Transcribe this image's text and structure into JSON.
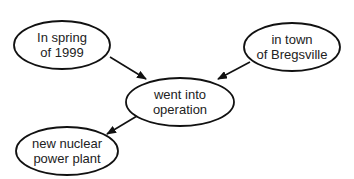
{
  "diagram": {
    "type": "concept-map",
    "colors": {
      "stroke": "#111111",
      "text": "#222222",
      "background": "#ffffff"
    },
    "nodes": [
      {
        "id": "time",
        "line1": "In spring",
        "line2": "of 1999",
        "cx": 62,
        "cy": 45,
        "rx": 48,
        "ry": 24
      },
      {
        "id": "place",
        "line1": "in town",
        "line2": "of Bregsville",
        "cx": 292,
        "cy": 47,
        "rx": 48,
        "ry": 24
      },
      {
        "id": "event",
        "line1": "went into",
        "line2": "operation",
        "cx": 180,
        "cy": 102,
        "rx": 54,
        "ry": 24
      },
      {
        "id": "subject",
        "line1": "new nuclear",
        "line2": "power plant",
        "cx": 67,
        "cy": 151,
        "rx": 51,
        "ry": 24
      }
    ],
    "edges": [
      {
        "from": "time",
        "to": "event"
      },
      {
        "from": "place",
        "to": "event"
      },
      {
        "from": "event",
        "to": "subject"
      }
    ]
  }
}
